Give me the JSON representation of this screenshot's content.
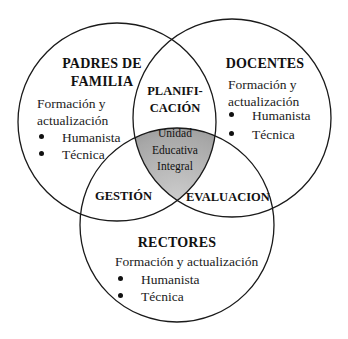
{
  "diagram": {
    "type": "venn-3",
    "circles": [
      {
        "id": "padres",
        "title_lines": [
          "PADRES DE",
          "FAMILIA"
        ],
        "subtitle_lines": [
          "Formación y",
          "actualización"
        ],
        "bullets": [
          "Humanista",
          "Técnica"
        ]
      },
      {
        "id": "docentes",
        "title_lines": [
          "DOCENTES"
        ],
        "subtitle_lines": [
          "Formación y",
          "actualización"
        ],
        "bullets": [
          "Humanista",
          "Técnica"
        ]
      },
      {
        "id": "rectores",
        "title_lines": [
          "RECTORES"
        ],
        "subtitle_lines": [
          "Formación y actualización"
        ],
        "bullets": [
          "Humanista",
          "Técnica"
        ]
      }
    ],
    "intersections": {
      "padres_docentes": [
        "PLANIFI-",
        "CACIÓN"
      ],
      "padres_rectores": "GESTIÓN",
      "docentes_rectores": "EVALUACION",
      "center": [
        "Unidad",
        "Educativa",
        "Integral"
      ]
    },
    "colors": {
      "stroke": "#1a1a1a",
      "center_fill": "#9a9a9a",
      "background": "#ffffff"
    }
  }
}
